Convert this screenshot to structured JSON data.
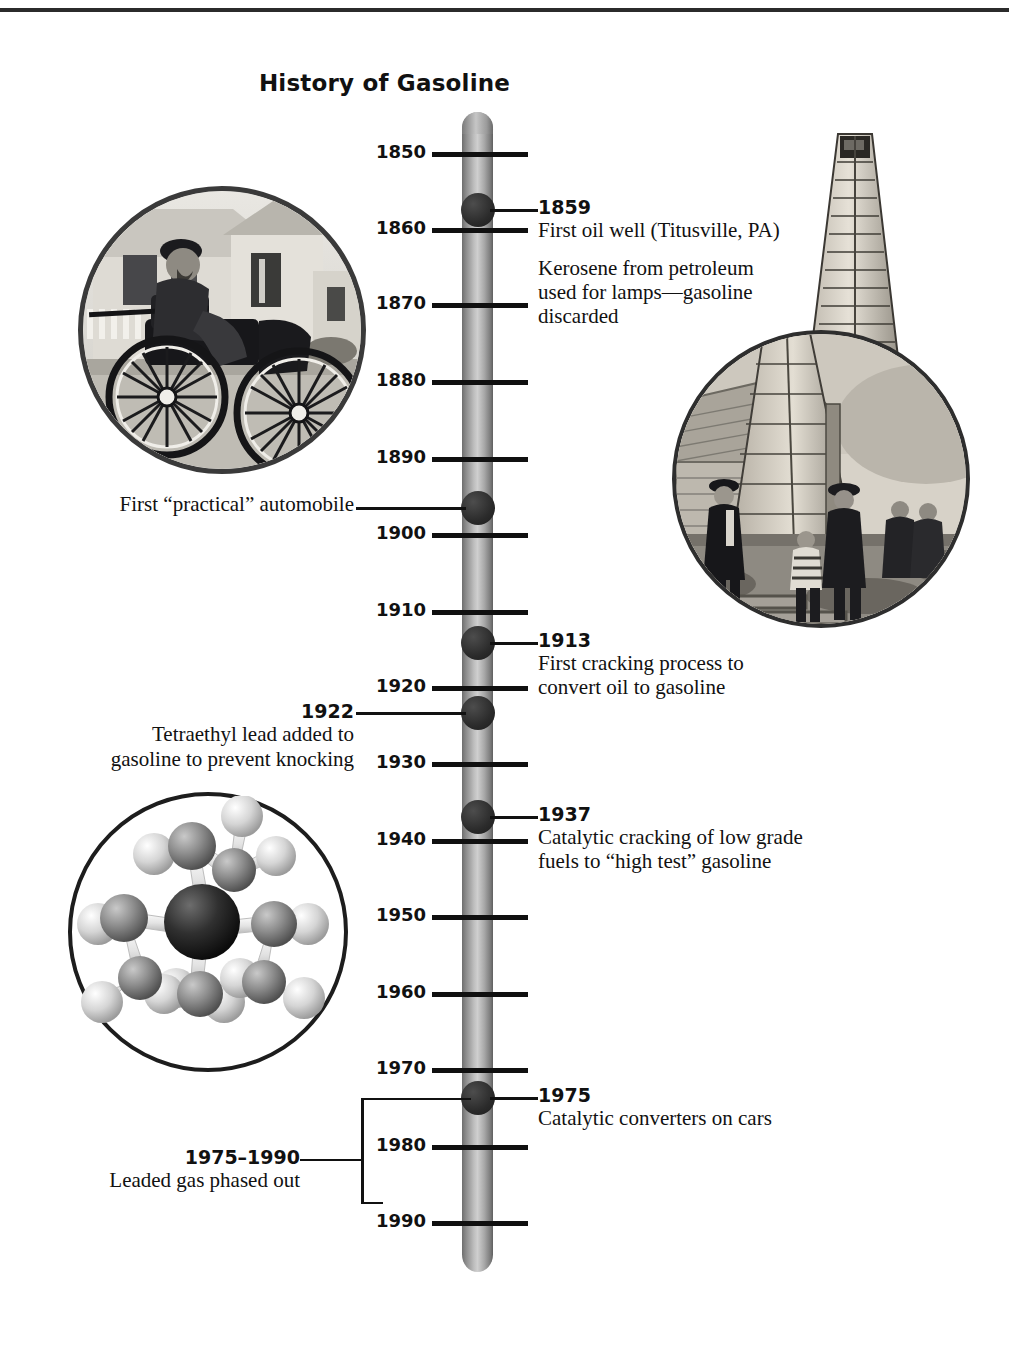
{
  "title": "History of Gasoline",
  "axis": {
    "ticks": [
      {
        "year": "1850",
        "y": 152
      },
      {
        "year": "1860",
        "y": 228
      },
      {
        "year": "1870",
        "y": 303
      },
      {
        "year": "1880",
        "y": 380
      },
      {
        "year": "1890",
        "y": 457
      },
      {
        "year": "1900",
        "y": 533
      },
      {
        "year": "1910",
        "y": 610
      },
      {
        "year": "1920",
        "y": 686
      },
      {
        "year": "1930",
        "y": 762
      },
      {
        "year": "1940",
        "y": 839
      },
      {
        "year": "1950",
        "y": 915
      },
      {
        "year": "1960",
        "y": 992
      },
      {
        "year": "1970",
        "y": 1068
      },
      {
        "year": "1980",
        "y": 1145
      },
      {
        "year": "1990",
        "y": 1221
      }
    ],
    "start_year": "1850",
    "end_year": "1990",
    "interval": "10"
  },
  "events": [
    {
      "id": "1859",
      "year": "1859",
      "y": 210,
      "side": "right",
      "headline": "First oil well (Titusville, PA)",
      "body": "Kerosene from petroleum\nused for lamps—gasoline\ndiscarded"
    },
    {
      "id": "1896",
      "year": "",
      "y": 508,
      "side": "left",
      "headline": "First “practical” automobile",
      "body": ""
    },
    {
      "id": "1913",
      "year": "1913",
      "y": 643,
      "side": "right",
      "headline": "First cracking process to\nconvert oil to gasoline",
      "body": ""
    },
    {
      "id": "1922",
      "year": "1922",
      "y": 713,
      "side": "left",
      "headline": "Tetraethyl lead added to\ngasoline to prevent knocking",
      "body": ""
    },
    {
      "id": "1937",
      "year": "1937",
      "y": 817,
      "side": "right",
      "headline": "Catalytic cracking of low grade\nfuels to “high test” gasoline",
      "body": ""
    },
    {
      "id": "1975",
      "year": "1975",
      "y": 1098,
      "side": "right",
      "headline": "Catalytic converters on cars",
      "body": ""
    },
    {
      "id": "1975-1990",
      "year": "1975–1990",
      "y": 1160,
      "side": "left",
      "headline": "Leaded gas phased out",
      "body": ""
    }
  ],
  "figures": [
    {
      "id": "automobile-photo",
      "caption": "First “practical” automobile",
      "kind": "photograph"
    },
    {
      "id": "oil-derrick-photo",
      "caption": "First oil well (Titusville, PA)",
      "kind": "photograph"
    },
    {
      "id": "tetraethyl-lead-molecule",
      "caption": "Tetraethyl lead molecule model",
      "kind": "illustration"
    }
  ],
  "colors": {
    "ink": "#111111",
    "bar_light": "#cfcfcf",
    "bar_dark": "#5f5f5f",
    "dot": "#2b2b2b",
    "rule": "#2b2b2b"
  }
}
